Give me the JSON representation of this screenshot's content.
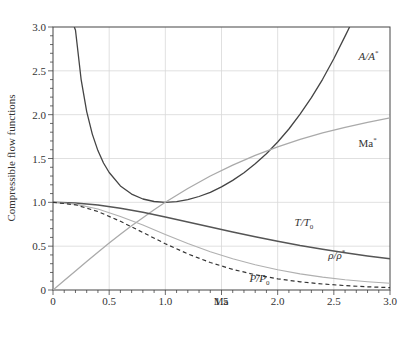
{
  "chart_data": {
    "type": "line",
    "title": "",
    "xlabel": "Ma",
    "ylabel": "Compressible flow functions",
    "xlim": [
      0,
      3.0
    ],
    "ylim": [
      0,
      3.0
    ],
    "grid": true,
    "x_ticks": [
      "0",
      "0.5",
      "1.0",
      "1.5",
      "2.0",
      "2.5",
      "3.0"
    ],
    "y_ticks": [
      "0",
      "0.5",
      "1.0",
      "1.5",
      "2.0",
      "2.5",
      "3.0"
    ],
    "x_tick_values": [
      0,
      0.5,
      1.0,
      1.5,
      2.0,
      2.5,
      3.0
    ],
    "y_tick_values": [
      0,
      0.5,
      1.0,
      1.5,
      2.0,
      2.5,
      3.0
    ],
    "legend": "inline labels",
    "gamma": 1.4,
    "series": [
      {
        "name": "A/A*",
        "label_text": "A/A*",
        "color": "#444444",
        "dash": "",
        "width": 1.3,
        "label_pos": [
          2.72,
          2.62
        ],
        "x": [
          0.19,
          0.2,
          0.25,
          0.3,
          0.35,
          0.4,
          0.45,
          0.5,
          0.6,
          0.7,
          0.8,
          0.9,
          1.0,
          1.1,
          1.2,
          1.3,
          1.4,
          1.5,
          1.6,
          1.7,
          1.8,
          1.9,
          2.0,
          2.1,
          2.2,
          2.3,
          2.4,
          2.5,
          2.6,
          2.64
        ],
        "values": [
          3.0,
          2.964,
          2.403,
          2.035,
          1.778,
          1.59,
          1.449,
          1.34,
          1.188,
          1.094,
          1.038,
          1.009,
          1.0,
          1.008,
          1.03,
          1.066,
          1.115,
          1.176,
          1.25,
          1.338,
          1.439,
          1.555,
          1.688,
          1.837,
          2.005,
          2.193,
          2.403,
          2.637,
          2.896,
          3.0
        ]
      },
      {
        "name": "Ma*",
        "label_text": "Ma*",
        "color": "#aaaaaa",
        "dash": "",
        "width": 1.3,
        "label_pos": [
          2.72,
          1.63
        ],
        "x": [
          0,
          0.1,
          0.2,
          0.3,
          0.4,
          0.5,
          0.6,
          0.7,
          0.8,
          0.9,
          1.0,
          1.2,
          1.4,
          1.6,
          1.8,
          2.0,
          2.2,
          2.4,
          2.6,
          2.8,
          3.0
        ],
        "values": [
          0,
          0.11,
          0.218,
          0.326,
          0.431,
          0.535,
          0.635,
          0.732,
          0.825,
          0.915,
          1.0,
          1.158,
          1.3,
          1.425,
          1.536,
          1.633,
          1.718,
          1.792,
          1.856,
          1.913,
          1.964
        ]
      },
      {
        "name": "T/T0",
        "label_text": "T/T0",
        "color": "#555555",
        "dash": "",
        "width": 1.5,
        "label_pos": [
          2.15,
          0.73
        ],
        "x": [
          0,
          0.2,
          0.4,
          0.6,
          0.8,
          1.0,
          1.2,
          1.4,
          1.6,
          1.8,
          2.0,
          2.2,
          2.4,
          2.6,
          2.8,
          3.0
        ],
        "values": [
          1.0,
          0.992,
          0.969,
          0.933,
          0.887,
          0.833,
          0.776,
          0.718,
          0.661,
          0.607,
          0.556,
          0.508,
          0.465,
          0.425,
          0.389,
          0.357
        ]
      },
      {
        "name": "rho/rho*",
        "label_text": "ρ/ρ*",
        "color": "#b0b0b0",
        "dash": "",
        "width": 1.1,
        "label_pos": [
          2.45,
          0.35
        ],
        "x": [
          0,
          0.2,
          0.4,
          0.6,
          0.8,
          1.0,
          1.2,
          1.4,
          1.6,
          1.8,
          2.0,
          2.2,
          2.4,
          2.6,
          2.8,
          3.0
        ],
        "values": [
          1.0,
          0.98,
          0.924,
          0.84,
          0.74,
          0.634,
          0.531,
          0.437,
          0.356,
          0.287,
          0.23,
          0.184,
          0.147,
          0.118,
          0.095,
          0.076
        ]
      },
      {
        "name": "P/P0",
        "label_text": "P/P0",
        "color": "#333333",
        "dash": "4,3",
        "width": 1.2,
        "label_pos": [
          1.75,
          0.09
        ],
        "x": [
          0,
          0.2,
          0.4,
          0.6,
          0.8,
          1.0,
          1.2,
          1.4,
          1.6,
          1.8,
          2.0,
          2.2,
          2.4,
          2.6,
          2.8,
          3.0
        ],
        "values": [
          1.0,
          0.972,
          0.896,
          0.784,
          0.656,
          0.528,
          0.412,
          0.314,
          0.235,
          0.174,
          0.128,
          0.094,
          0.068,
          0.05,
          0.037,
          0.027
        ]
      }
    ]
  },
  "plot_box": {
    "left": 53,
    "right": 390,
    "top": 27,
    "bottom": 290
  },
  "colors": {
    "grid": "#d8d8d8",
    "axis": "#444444",
    "text": "#333333"
  }
}
